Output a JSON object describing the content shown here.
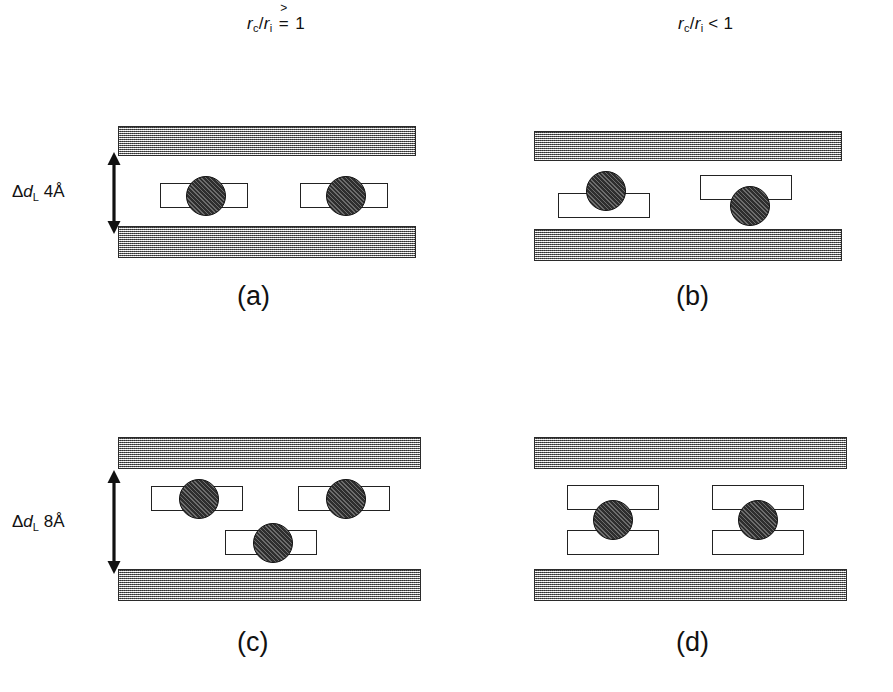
{
  "figure": {
    "width": 893,
    "height": 692,
    "background": "#ffffff",
    "slab_color": "#9c9c9c",
    "ball_color": "#2e2e2e",
    "plate_color": "#ffffff",
    "line_color": "#222222"
  },
  "headers": [
    {
      "id": "left",
      "numerator": "r",
      "num_sub": "c",
      "denominator": "r",
      "den_sub": "i",
      "relation": "≥",
      "relation_parts": {
        "top": ">",
        "bottom": "="
      },
      "value": "1",
      "text": "rc/ri ≥ 1"
    },
    {
      "id": "right",
      "numerator": "r",
      "num_sub": "c",
      "denominator": "r",
      "den_sub": "i",
      "relation": "<",
      "value": "1",
      "text": "rc/ri < 1"
    }
  ],
  "row_labels": [
    {
      "id": "top-row",
      "delta": "Δ",
      "symbol": "d",
      "sub": "L",
      "value": "4Å",
      "text": "ΔdL 4Å"
    },
    {
      "id": "bottom-row",
      "delta": "Δ",
      "symbol": "d",
      "sub": "L",
      "value": "8Å",
      "text": "ΔdL 8Å"
    }
  ],
  "panels": [
    {
      "id": "a",
      "label": "(a)",
      "gap": "4Å",
      "description": "balls centered on single plates"
    },
    {
      "id": "b",
      "label": "(b)",
      "gap": "4Å",
      "description": "balls offset above and below plates"
    },
    {
      "id": "c",
      "label": "(c)",
      "gap": "8Å",
      "description": "three plate-ball units staggered in two levels"
    },
    {
      "id": "d",
      "label": "(d)",
      "gap": "8Å",
      "description": "balls sandwiched between paired plates"
    }
  ]
}
